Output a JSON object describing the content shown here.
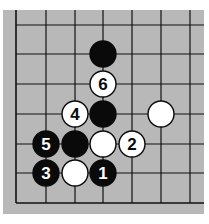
{
  "diagram": {
    "type": "go-board-fragment",
    "background_color": "#b8b8b8",
    "line_color": "#111111",
    "board_edges_visible": [
      "left",
      "bottom"
    ],
    "grid": {
      "x_lines": [
        16,
        46,
        75,
        103,
        132,
        161,
        190
      ],
      "y_lines": [
        25,
        54,
        84,
        114,
        144,
        173,
        203
      ]
    },
    "stone_radius": 13,
    "stones": [
      {
        "color": "black",
        "col": 3,
        "row": 1,
        "label": ""
      },
      {
        "color": "white",
        "col": 3,
        "row": 2,
        "label": "6"
      },
      {
        "color": "black",
        "col": 3,
        "row": 3,
        "label": ""
      },
      {
        "color": "white",
        "col": 2,
        "row": 3,
        "label": "4"
      },
      {
        "color": "white",
        "col": 5,
        "row": 3,
        "label": ""
      },
      {
        "color": "black",
        "col": 1,
        "row": 4,
        "label": "5"
      },
      {
        "color": "black",
        "col": 2,
        "row": 4,
        "label": ""
      },
      {
        "color": "white",
        "col": 3,
        "row": 4,
        "label": ""
      },
      {
        "color": "white",
        "col": 4,
        "row": 4,
        "label": "2"
      },
      {
        "color": "black",
        "col": 1,
        "row": 5,
        "label": "3"
      },
      {
        "color": "white",
        "col": 2,
        "row": 5,
        "label": ""
      },
      {
        "color": "black",
        "col": 3,
        "row": 5,
        "label": "1"
      }
    ]
  }
}
